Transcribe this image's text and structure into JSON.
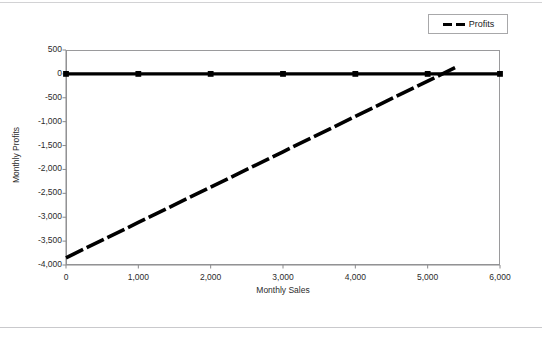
{
  "chart_data": {
    "type": "line",
    "title": "",
    "xlabel": "Monthly Sales",
    "ylabel": "Monthly Profits",
    "xlim": [
      0,
      6000
    ],
    "ylim": [
      -4000,
      500
    ],
    "grid": false,
    "legend_position": "top-right",
    "x_ticks": [
      "0",
      "1,000",
      "2,000",
      "3,000",
      "4,000",
      "5,000",
      "6,000"
    ],
    "x_tick_values": [
      0,
      1000,
      2000,
      3000,
      4000,
      5000,
      6000
    ],
    "y_ticks": [
      "500",
      "0",
      "-500",
      "-1,000",
      "-1,500",
      "-2,000",
      "-2,500",
      "-3,000",
      "-3,500",
      "-4,000"
    ],
    "y_tick_values": [
      500,
      0,
      -500,
      -1000,
      -1500,
      -2000,
      -2500,
      -3000,
      -3500,
      -4000
    ],
    "series": [
      {
        "name": "Zero Line",
        "style": "solid-thick-with-square-markers",
        "x": [
          0,
          1000,
          2000,
          3000,
          4000,
          5000,
          6000
        ],
        "values": [
          0,
          0,
          0,
          0,
          0,
          0,
          0
        ]
      },
      {
        "name": "Profits",
        "style": "dashed-thick",
        "x": [
          0,
          1000,
          2000,
          3000,
          4000,
          5000,
          5400
        ],
        "values": [
          -3850,
          -3110,
          -2370,
          -1630,
          -890,
          -150,
          146
        ]
      }
    ]
  },
  "legend": {
    "entries": [
      {
        "label": "Profits",
        "color": "#000000",
        "marker": "dashed-line"
      }
    ]
  }
}
